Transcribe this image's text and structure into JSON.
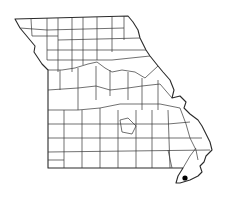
{
  "map": {
    "region": "Missouri",
    "subdivisions": "counties",
    "background_color": "#ffffff",
    "line_color": "#2a2a2a",
    "markers": [
      {
        "type": "occurrence-dot",
        "location": "southeast bootheel",
        "x": 185,
        "y": 178,
        "color": "#000000"
      }
    ]
  }
}
